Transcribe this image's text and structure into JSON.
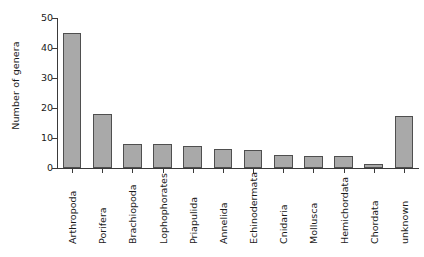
{
  "chart_data": {
    "type": "bar",
    "title": "",
    "xlabel": "",
    "ylabel": "Number of genera",
    "ylim": [
      0,
      50
    ],
    "yticks": [
      0,
      10,
      20,
      30,
      40,
      50
    ],
    "grid": false,
    "legend": null,
    "bar_color": "#a9a9a9",
    "bar_edge_color": "#4f4f4f",
    "categories": [
      "Arthropoda",
      "Porifera",
      "Brachiopoda",
      "Lophophorates",
      "Priapulida",
      "Annelida",
      "Echinodermata",
      "Cnidaria",
      "Mollusca",
      "Hemichordata",
      "Chordata",
      "unknown"
    ],
    "values": [
      45,
      18,
      8,
      8,
      7.5,
      6.5,
      6,
      4.5,
      4,
      4,
      1.5,
      17.5
    ]
  },
  "caption": {
    "text": ""
  }
}
